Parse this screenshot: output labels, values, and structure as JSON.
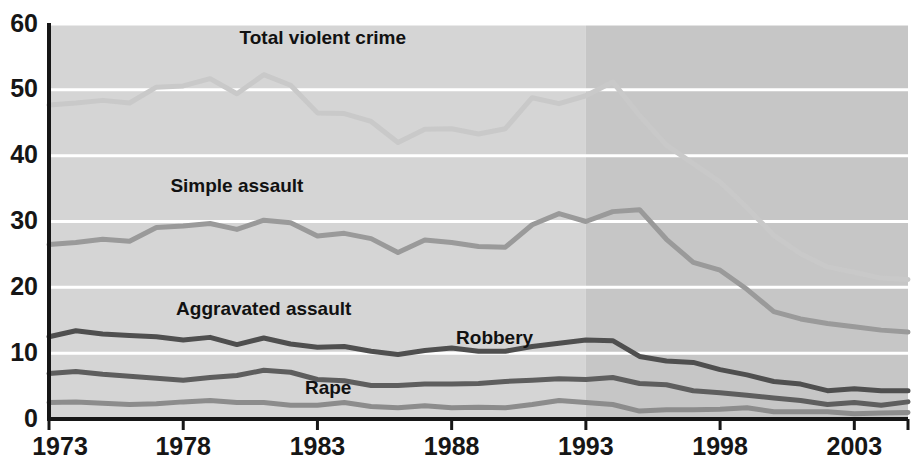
{
  "chart_data": {
    "type": "line",
    "title": "",
    "subtitle": "",
    "xlabel": "",
    "ylabel": "",
    "xlim": [
      1973,
      2005
    ],
    "ylim": [
      0,
      60
    ],
    "grid": true,
    "legend_position": "inline-labels",
    "y_ticks": [
      "0",
      "10",
      "20",
      "30",
      "40",
      "50",
      "60"
    ],
    "y_tick_values": [
      0,
      10,
      20,
      30,
      40,
      50,
      60
    ],
    "x_ticks": [
      "1973",
      "1978",
      "1983",
      "1988",
      "1993",
      "1998",
      "2003"
    ],
    "x_tick_values": [
      1973,
      1978,
      1983,
      1988,
      1993,
      1998,
      2003
    ],
    "x": [
      1973,
      1974,
      1975,
      1976,
      1977,
      1978,
      1979,
      1980,
      1981,
      1982,
      1983,
      1984,
      1985,
      1986,
      1987,
      1988,
      1989,
      1990,
      1991,
      1992,
      1993,
      1994,
      1995,
      1996,
      1997,
      1998,
      1999,
      2000,
      2001,
      2002,
      2003,
      2004,
      2005
    ],
    "shaded_region": {
      "from": 1993,
      "to": 2005,
      "note": "darker shaded band beginning at 1993"
    },
    "series": [
      {
        "name": "Total violent crime",
        "color": "#c9c9c9",
        "label_x": 1983.2,
        "label_y": 57.0,
        "values": [
          47.7,
          48.0,
          48.4,
          48.0,
          50.4,
          50.6,
          51.7,
          49.4,
          52.3,
          50.7,
          46.5,
          46.4,
          45.2,
          42.0,
          44.0,
          44.1,
          43.3,
          44.1,
          48.8,
          47.9,
          49.1,
          51.2,
          46.1,
          41.6,
          38.8,
          36.0,
          32.1,
          27.9,
          25.1,
          23.1,
          22.3,
          21.4,
          21.2
        ]
      },
      {
        "name": "Simple assault",
        "color": "#9a9a9a",
        "label_x": 1980.0,
        "label_y": 34.5,
        "values": [
          26.5,
          26.8,
          27.3,
          27.0,
          29.1,
          29.3,
          29.7,
          28.8,
          30.2,
          29.8,
          27.8,
          28.2,
          27.4,
          25.3,
          27.2,
          26.8,
          26.2,
          26.1,
          29.5,
          31.2,
          30.0,
          31.5,
          31.8,
          27.3,
          23.8,
          22.6,
          19.7,
          16.3,
          15.2,
          14.5,
          14.0,
          13.5,
          13.2
        ]
      },
      {
        "name": "Aggravated assault",
        "color": "#4f4f4f",
        "label_x": 1981.0,
        "label_y": 15.8,
        "values": [
          12.5,
          13.4,
          12.9,
          12.7,
          12.5,
          12.0,
          12.4,
          11.3,
          12.3,
          11.4,
          10.9,
          11.0,
          10.3,
          9.8,
          10.4,
          10.8,
          10.3,
          10.3,
          11.0,
          11.5,
          12.0,
          11.9,
          9.5,
          8.8,
          8.6,
          7.5,
          6.7,
          5.7,
          5.3,
          4.3,
          4.6,
          4.3,
          4.3
        ]
      },
      {
        "name": "Robbery",
        "color": "#5e5e5e",
        "label_x": 1989.6,
        "label_y": 11.4,
        "values": [
          6.9,
          7.2,
          6.8,
          6.5,
          6.2,
          5.9,
          6.3,
          6.6,
          7.4,
          7.1,
          6.0,
          5.8,
          5.1,
          5.1,
          5.3,
          5.3,
          5.4,
          5.7,
          5.9,
          6.1,
          6.0,
          6.3,
          5.4,
          5.2,
          4.3,
          4.0,
          3.6,
          3.2,
          2.8,
          2.2,
          2.5,
          2.1,
          2.6
        ]
      },
      {
        "name": "Rape",
        "color": "#8c8c8c",
        "label_x": 1983.4,
        "label_y": 3.8,
        "values": [
          2.5,
          2.6,
          2.4,
          2.2,
          2.3,
          2.6,
          2.8,
          2.5,
          2.5,
          2.1,
          2.1,
          2.5,
          1.9,
          1.7,
          2.0,
          1.7,
          1.8,
          1.7,
          2.2,
          2.8,
          2.5,
          2.2,
          1.2,
          1.4,
          1.4,
          1.5,
          1.7,
          1.1,
          1.1,
          1.1,
          0.8,
          0.9,
          1.0
        ]
      }
    ]
  },
  "axis": {
    "axis_color": "#161616",
    "gridline_color": "#ffffff",
    "plot_background": "#d5d5d5",
    "plot_background_shaded": "#c6c6c6",
    "page_background": "#ffffff"
  }
}
